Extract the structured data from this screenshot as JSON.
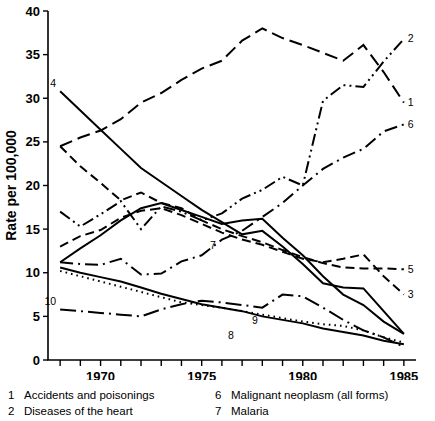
{
  "chart_data": {
    "type": "line",
    "title": "",
    "xlabel": "",
    "ylabel": "Rate per 100,000",
    "xlim": [
      1967.4,
      1985.6
    ],
    "ylim": [
      0,
      40
    ],
    "grid": false,
    "legend_position": "bottom",
    "x_ticks": [
      1968,
      1969,
      1970,
      1971,
      1972,
      1973,
      1974,
      1975,
      1976,
      1977,
      1978,
      1979,
      1980,
      1981,
      1982,
      1983,
      1984,
      1985
    ],
    "x_tick_labels": [
      "",
      "",
      "1970",
      "",
      "",
      "",
      "",
      "1975",
      "",
      "",
      "",
      "",
      "1980",
      "",
      "",
      "",
      "",
      "1985"
    ],
    "y_ticks": [
      0,
      5,
      10,
      15,
      20,
      25,
      30,
      35,
      40
    ],
    "y_tick_labels": [
      "0",
      "5",
      "10",
      "15",
      "20",
      "25",
      "30",
      "35",
      "40"
    ],
    "x": [
      1968,
      1969,
      1970,
      1971,
      1972,
      1973,
      1974,
      1975,
      1976,
      1977,
      1978,
      1979,
      1980,
      1981,
      1982,
      1983,
      1984,
      1985
    ],
    "series": [
      {
        "name": "1",
        "label": "Accidents and poisonings",
        "dash": "long-dash",
        "end_label_value": 29.5,
        "values": [
          24.5,
          25.5,
          26.3,
          27.6,
          29.5,
          30.6,
          32.1,
          33.4,
          34.3,
          36.6,
          38.0,
          36.9,
          36.1,
          35.2,
          34.3,
          36.1,
          33.0,
          29.5
        ]
      },
      {
        "name": "2",
        "label": "Diseases of the heart",
        "dash": "dash-dot-dot",
        "end_label_value": 36.8,
        "values": [
          17.0,
          15.3,
          16.7,
          18.2,
          15.0,
          17.6,
          17.0,
          16.0,
          16.8,
          18.5,
          19.5,
          21.0,
          20.0,
          29.7,
          31.5,
          31.3,
          34.2,
          36.8
        ]
      },
      {
        "name": "3",
        "label": "",
        "dash": "dash",
        "end_label_value": 7.5,
        "values": [
          13.0,
          14.2,
          14.9,
          16.3,
          17.1,
          17.4,
          16.6,
          15.6,
          14.6,
          13.8,
          13.2,
          12.4,
          11.6,
          11.2,
          11.6,
          12.1,
          9.6,
          7.5
        ]
      },
      {
        "name": "4",
        "label": "",
        "dash": "solid",
        "start_label_value": 30.8,
        "values": [
          30.8,
          28.6,
          26.4,
          24.2,
          22.0,
          20.4,
          18.8,
          17.2,
          15.8,
          14.4,
          14.8,
          13.0,
          11.0,
          8.8,
          8.3,
          8.2,
          5.6,
          3.0
        ]
      },
      {
        "name": "5",
        "label": "",
        "dash": "dash",
        "end_label_value": 10.4,
        "values": [
          24.5,
          22.2,
          20.3,
          18.3,
          19.2,
          18.0,
          17.4,
          16.0,
          15.0,
          14.2,
          13.5,
          12.6,
          11.8,
          11.1,
          10.6,
          10.5,
          10.5,
          10.4
        ]
      },
      {
        "name": "6",
        "label": "Malignant neoplasm (all forms)",
        "dash": "dash-dot",
        "end_label_value": 27.0,
        "values": [
          11.2,
          11.0,
          10.9,
          11.6,
          9.8,
          9.9,
          11.3,
          12.0,
          13.8,
          14.8,
          16.4,
          18.0,
          20.0,
          21.9,
          23.2,
          24.2,
          26.2,
          27.0
        ]
      },
      {
        "name": "7",
        "label": "Malaria",
        "dash": "solid",
        "values": [
          11.2,
          12.8,
          14.3,
          16.0,
          17.4,
          18.0,
          17.2,
          16.4,
          15.6,
          16.0,
          16.2,
          14.0,
          12.0,
          9.6,
          7.5,
          6.3,
          4.4,
          3.0
        ]
      },
      {
        "name": "8",
        "label": "",
        "dash": "solid",
        "label_value": 3.2,
        "values": [
          10.6,
          10.0,
          9.5,
          9.0,
          8.3,
          7.6,
          7.0,
          6.4,
          6.0,
          5.6,
          5.0,
          4.6,
          4.2,
          3.6,
          3.2,
          2.8,
          2.2,
          1.8
        ]
      },
      {
        "name": "9",
        "label": "",
        "dash": "dotted",
        "label_value": 4.0,
        "values": [
          10.2,
          9.6,
          9.0,
          8.4,
          7.8,
          7.2,
          6.6,
          6.3,
          6.0,
          5.6,
          5.2,
          4.8,
          4.4,
          4.1,
          3.9,
          3.4,
          2.6,
          2.0
        ]
      },
      {
        "name": "10",
        "label": "",
        "dash": "dash-dot-long",
        "start_label_value": 5.8,
        "values": [
          5.8,
          5.6,
          5.4,
          5.2,
          5.0,
          5.8,
          6.4,
          6.8,
          6.6,
          6.3,
          6.0,
          7.5,
          7.3,
          6.0,
          4.6,
          3.4,
          2.6,
          1.5
        ]
      }
    ]
  },
  "legend": {
    "left_column": [
      {
        "num": "1",
        "text": "Accidents and poisonings"
      },
      {
        "num": "2",
        "text": "Diseases of the heart"
      }
    ],
    "right_column": [
      {
        "num": "6",
        "text": "Malignant neoplasm (all forms)"
      },
      {
        "num": "7",
        "text": "Malaria"
      }
    ]
  }
}
